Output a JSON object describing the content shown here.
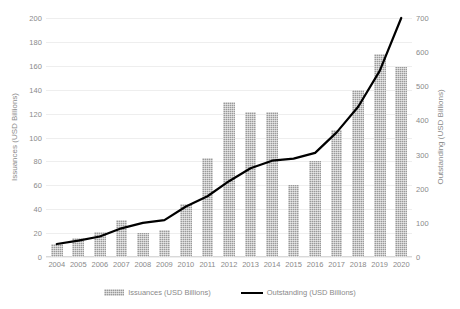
{
  "chart_data": {
    "type": "bar",
    "title": "",
    "subtitle": "",
    "xlabel": "",
    "ylabel": "Issuances (USD Billions)",
    "y2label": "Outstanding (USD Billions)",
    "categories": [
      "2004",
      "2005",
      "2006",
      "2007",
      "2008",
      "2009",
      "2010",
      "2011",
      "2012",
      "2013",
      "2014",
      "2015",
      "2016",
      "2017",
      "2018",
      "2019",
      "2020"
    ],
    "ylim": [
      0,
      200
    ],
    "y2lim": [
      0,
      700
    ],
    "yticks": [
      0,
      20,
      40,
      60,
      80,
      100,
      120,
      140,
      160,
      180,
      200
    ],
    "y2ticks": [
      0,
      100,
      200,
      300,
      400,
      500,
      600,
      700
    ],
    "grid": true,
    "legend_position": "bottom",
    "series": [
      {
        "name": "Issuances (USD Billions)",
        "type": "bar",
        "axis": "left",
        "color": "#9a9a9a",
        "values": [
          11,
          16,
          21,
          31,
          20,
          23,
          44,
          83,
          130,
          121,
          121,
          60,
          80,
          106,
          140,
          170,
          159
        ]
      },
      {
        "name": "Outstanding (USD Billions)",
        "type": "line",
        "axis": "right",
        "color": "#000000",
        "values": [
          38,
          48,
          60,
          84,
          100,
          108,
          148,
          178,
          222,
          260,
          282,
          288,
          305,
          365,
          440,
          545,
          700
        ]
      }
    ]
  },
  "axes": {
    "left_title": "Issuances (USD Billions)",
    "right_title": "Outstanding (USD Billions)"
  },
  "legend": {
    "items": [
      {
        "label": "Issuances (USD Billions)",
        "marker": "bar-swatch-icon"
      },
      {
        "label": "Outstanding (USD Billions)",
        "marker": "line-swatch-icon"
      }
    ]
  }
}
